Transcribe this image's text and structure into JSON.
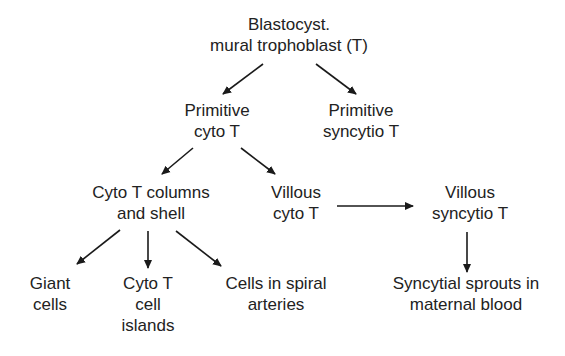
{
  "diagram": {
    "type": "flowchart",
    "nodes": {
      "blastocyst": {
        "line1": "Blastocyst.",
        "line2": "mural trophoblast (T)"
      },
      "primitive_cyto": {
        "line1": "Primitive",
        "line2": "cyto T"
      },
      "primitive_syncytio": {
        "line1": "Primitive",
        "line2": "syncytio T"
      },
      "cyto_columns": {
        "line1": "Cyto T columns",
        "line2": "and shell"
      },
      "villous_cyto": {
        "line1": "Villous",
        "line2": "cyto T"
      },
      "villous_syncytio": {
        "line1": "Villous",
        "line2": "syncytio T"
      },
      "giant_cells": {
        "line1": "Giant",
        "line2": "cells"
      },
      "cell_islands": {
        "line1": "Cyto T",
        "line2": "cell",
        "line3": "islands"
      },
      "spiral_arteries": {
        "line1": "Cells in spiral",
        "line2": "arteries"
      },
      "syncytial_sprouts": {
        "line1": "Syncytial sprouts in",
        "line2": "maternal blood"
      }
    },
    "edges": [
      {
        "from": "blastocyst",
        "to": "primitive_cyto"
      },
      {
        "from": "blastocyst",
        "to": "primitive_syncytio"
      },
      {
        "from": "primitive_cyto",
        "to": "cyto_columns"
      },
      {
        "from": "primitive_cyto",
        "to": "villous_cyto"
      },
      {
        "from": "cyto_columns",
        "to": "giant_cells"
      },
      {
        "from": "cyto_columns",
        "to": "cell_islands"
      },
      {
        "from": "cyto_columns",
        "to": "spiral_arteries"
      },
      {
        "from": "villous_cyto",
        "to": "villous_syncytio"
      },
      {
        "from": "villous_syncytio",
        "to": "syncytial_sprouts"
      }
    ],
    "colors": {
      "text": "#222222",
      "arrow": "#1a1a1a",
      "background": "#ffffff"
    }
  }
}
